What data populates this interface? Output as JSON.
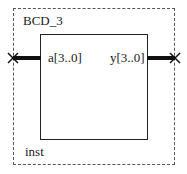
{
  "symbol": {
    "name": "BCD_3",
    "instance": "inst",
    "ports": {
      "input": {
        "label": "a[3..0]"
      },
      "output": {
        "label": "y[3..0]"
      }
    }
  }
}
